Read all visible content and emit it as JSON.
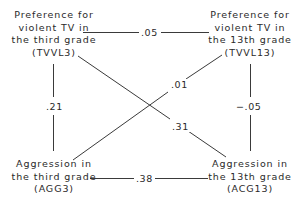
{
  "diagram": {
    "type": "cross-lagged panel",
    "nodes": {
      "tvvl3": {
        "lines": [
          "Preference for",
          "violent TV in",
          "the third grade",
          "(TVVL3)"
        ]
      },
      "tvvl13": {
        "lines": [
          "Preference for",
          "violent TV in",
          "the 13th grade",
          "(TVVL13)"
        ]
      },
      "agg3": {
        "lines": [
          "Aggression in",
          "the third grade",
          "(AGG3)"
        ]
      },
      "agg13": {
        "lines": [
          "Aggression in",
          "the 13th grade",
          "(ACG13)"
        ]
      }
    },
    "edges": {
      "tvvl3_tvvl13": ".05",
      "tvvl3_agg3": ".21",
      "tvvl13_agg13": "−.05",
      "agg3_tvvl13": ".01",
      "tvvl3_agg13": ".31",
      "agg3_agg13": ".38"
    },
    "line_color": "#3a3a3a"
  }
}
